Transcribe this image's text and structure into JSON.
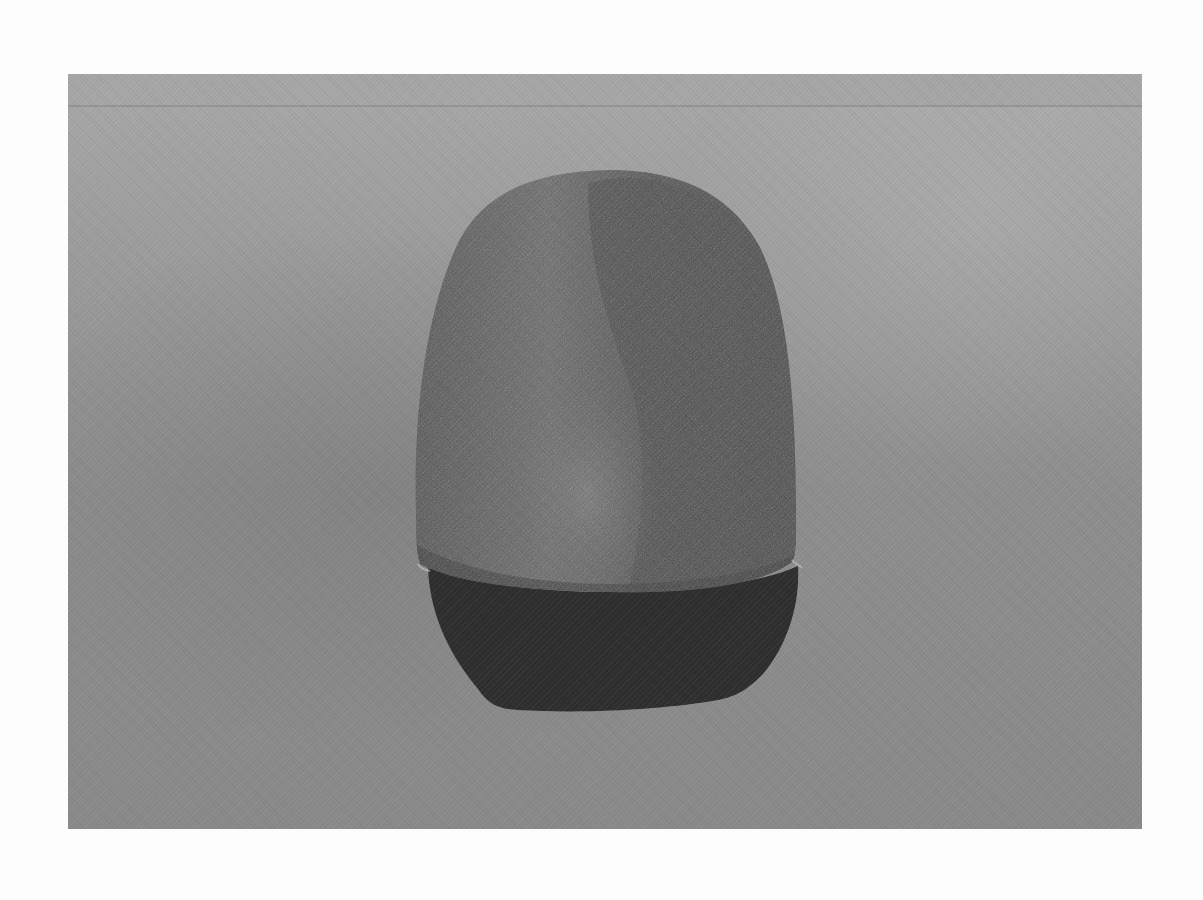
{
  "image": {
    "subject": "stone artifact with reflection",
    "style": "black-and-white photograph",
    "colors": {
      "page_background": "#fdfdfd",
      "backdrop_light": "#a9a9a9",
      "backdrop_dark": "#8a8a8a",
      "stone_light": "#6a6a6a",
      "stone_dark": "#4c4c4c",
      "reflection": "#2f2f2f"
    }
  }
}
